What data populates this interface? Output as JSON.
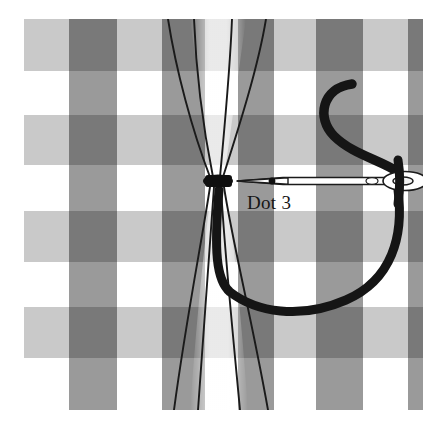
{
  "illustration": {
    "title": "Gathering stitch on gingham at Dot 3",
    "annotation_label": "Dot 3",
    "caption_alt": "A threaded needle passing through gathered gingham fabric held by a knot at Dot 3"
  },
  "fabric": {
    "pattern_name": "gingham-check",
    "colors": {
      "background": "#ffffff",
      "stripe_light": "#c9c9c9",
      "stripe_mid": "#9a9a9a",
      "intersection_dark": "#6a6a6a",
      "paper": "#ffffff"
    },
    "bounds": {
      "x": 24,
      "y": 19,
      "width": 399,
      "height": 391
    },
    "vertical_bands": [
      {
        "x": 24,
        "width": 45,
        "shade": "light"
      },
      {
        "x": 69,
        "width": 48,
        "shade": "dark"
      },
      {
        "x": 117,
        "width": 45,
        "shade": "light"
      },
      {
        "x": 162,
        "width": 43,
        "shade": "dark"
      },
      {
        "x": 205,
        "width": 33,
        "shade": "light"
      },
      {
        "x": 238,
        "width": 36,
        "shade": "dark"
      },
      {
        "x": 274,
        "width": 42,
        "shade": "light"
      },
      {
        "x": 316,
        "width": 47,
        "shade": "dark"
      },
      {
        "x": 363,
        "width": 45,
        "shade": "light"
      },
      {
        "x": 408,
        "width": 15,
        "shade": "dark"
      }
    ],
    "horizontal_bands": [
      {
        "y": 19,
        "height": 52,
        "shade": "light"
      },
      {
        "y": 115,
        "height": 50,
        "shade": "light"
      },
      {
        "y": 211,
        "height": 51,
        "shade": "light"
      },
      {
        "y": 307,
        "height": 51,
        "shade": "light"
      }
    ]
  },
  "thread": {
    "color": "#151515",
    "knot": {
      "cx": 218,
      "cy": 181,
      "rx": 15,
      "ry": 6
    },
    "dot_marker": {
      "cx": 272,
      "cy": 181,
      "r": 3
    },
    "needle": {
      "tip_x": 236,
      "eye_x": 418,
      "y": 181,
      "body_color": "#ffffff",
      "outline_color": "#1b1b1b"
    },
    "label_position": {
      "x": 247,
      "y": 207
    }
  },
  "gathers": {
    "stroke_color": "#1a1a1a",
    "count": 4,
    "pinch_point": {
      "x": 218,
      "y": 181
    }
  }
}
